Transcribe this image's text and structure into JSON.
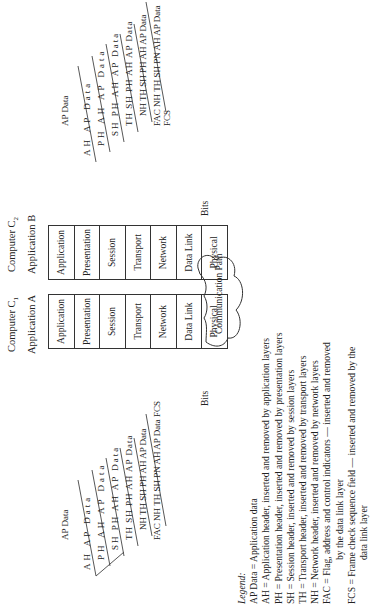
{
  "diagram": {
    "orientation": "rotated-90-ccw",
    "computer_left": {
      "label": "Computer C",
      "sub": "1",
      "app": "Application A"
    },
    "computer_right": {
      "label": "Computer C",
      "sub": "2",
      "app": "Application B"
    },
    "layers": [
      "Application",
      "Presentation",
      "Session",
      "Transport",
      "Network",
      "Data Link",
      "Physical"
    ],
    "communication_path": "Communication Path",
    "bits_label": "Bits",
    "encapsulation": {
      "top": "AP Data",
      "rows": [
        [
          "AH",
          "AP",
          "Data"
        ],
        [
          "PH",
          "AH",
          "AP",
          "Data"
        ],
        [
          "SH",
          "PH",
          "AH",
          "AP",
          "Data"
        ],
        [
          "TH",
          "SH",
          "PH",
          "AH",
          "AP",
          "Data"
        ],
        [
          "NH",
          "TH",
          "SH",
          "PH",
          "AH",
          "AP",
          "Data"
        ],
        [
          "FAC",
          "NH",
          "TH",
          "SH",
          "PN",
          "AH",
          "AP",
          "Data",
          "FCS"
        ]
      ]
    },
    "legend": {
      "title": "Legend:",
      "items": [
        "AP Data = Application data",
        "AH = Application header, inserted and removed by application layers",
        "PH = Presentation header, inserted and removed by presentation layers",
        "SH = Session header, inserted and removed by session layers",
        "TH = Transport header, inserted and removed by transport layers",
        "NH = Network header, inserted and removed by network layers",
        "FAC = Flag, address and control indicators — inserted and removed",
        "by the data link layer",
        "FCS = Frame check sequence field — inserted and removed by the",
        "data link layer"
      ]
    }
  }
}
